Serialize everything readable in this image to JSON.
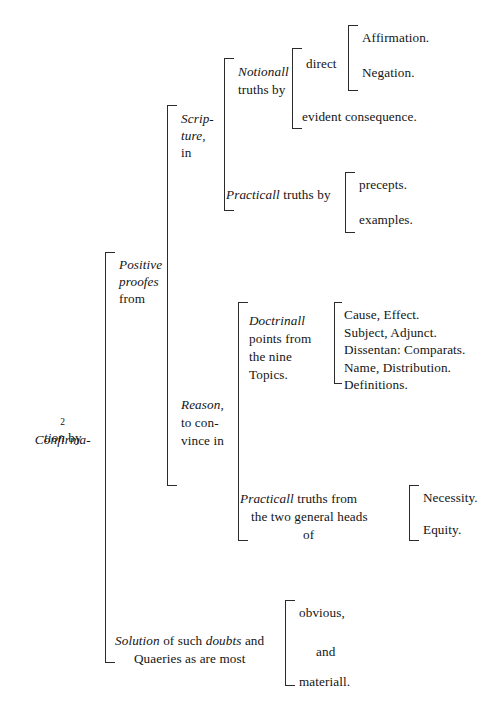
{
  "document": {
    "type": "bracketed-outline-diagram",
    "page_background": "#ffffff",
    "ink_color": "#141414",
    "rule_color": "#2b2b2b"
  },
  "root": {
    "number": "2",
    "label_italic": "Confirma-",
    "label_italic_line2": "tion",
    "label_roman_line2": " by",
    "line1": "2 Confirma-",
    "line2": "tion by"
  },
  "branches": {
    "positive": {
      "line1": "Positive",
      "line2": "proofes",
      "line3": "from"
    },
    "scripture": {
      "line1": "Scrip-",
      "line2": "ture,",
      "line3": "in"
    },
    "notionall": {
      "italic": "Notionall",
      "roman": "truths by"
    },
    "direct": {
      "label": "direct"
    },
    "affirmation": {
      "label": "Affirmation."
    },
    "negation": {
      "label": "Negation."
    },
    "evident_consequence": {
      "label": "evident consequence."
    },
    "practicall_scripture": {
      "italic": "Practicall",
      "roman": " truths by"
    },
    "precepts": {
      "label": "precepts."
    },
    "examples": {
      "label": "examples."
    },
    "reason": {
      "line1": "Reason,",
      "line2": "to con-",
      "line3": "vince in"
    },
    "doctrinall": {
      "line1_italic": "Doctrinall",
      "line2": "points from",
      "line3": "the nine",
      "line4": "Topics."
    },
    "topics": {
      "items": [
        "Cause, Effect.",
        "Subject, Adjunct.",
        "Dissentan: Comparats.",
        "Name, Distribution.",
        "Definitions."
      ]
    },
    "practicall_reason": {
      "line1_italic": "Practicall",
      "line1_roman": " truths from",
      "line2": "the two general heads",
      "line3": "of"
    },
    "necessity": {
      "label": "Necessity."
    },
    "equity": {
      "label": "Equity."
    },
    "solution": {
      "line1_a_italic": "Solution",
      "line1_b": " of such ",
      "line1_c_italic": "doubts",
      "line1_d": " and",
      "line2": "Quaeries as are most"
    },
    "obvious": {
      "label": "obvious,"
    },
    "and": {
      "label": "and"
    },
    "materiall": {
      "label": "materiall."
    }
  }
}
